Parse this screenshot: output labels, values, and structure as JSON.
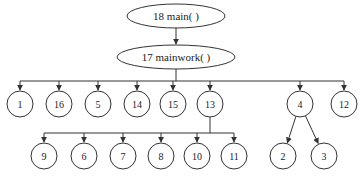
{
  "diagram": {
    "type": "call-tree",
    "nodes": [
      {
        "id": "18",
        "label": "18   main( )",
        "shape": "ellipse",
        "cx": 176,
        "cy": 16,
        "rx": 49,
        "ry": 12
      },
      {
        "id": "17",
        "label": "17   mainwork( )",
        "shape": "ellipse",
        "cx": 176,
        "cy": 57,
        "rx": 59,
        "ry": 12
      },
      {
        "id": "1",
        "label": "1",
        "shape": "circle",
        "cx": 20,
        "cy": 104
      },
      {
        "id": "16",
        "label": "16",
        "shape": "circle",
        "cx": 59,
        "cy": 104
      },
      {
        "id": "5",
        "label": "5",
        "shape": "circle",
        "cx": 98,
        "cy": 104
      },
      {
        "id": "14",
        "label": "14",
        "shape": "circle",
        "cx": 137,
        "cy": 104
      },
      {
        "id": "15",
        "label": "15",
        "shape": "circle",
        "cx": 173,
        "cy": 104
      },
      {
        "id": "13",
        "label": "13",
        "shape": "circle",
        "cx": 210,
        "cy": 104
      },
      {
        "id": "4",
        "label": "4",
        "shape": "circle",
        "cx": 300,
        "cy": 104
      },
      {
        "id": "12",
        "label": "12",
        "shape": "circle",
        "cx": 344,
        "cy": 104
      },
      {
        "id": "9",
        "label": "9",
        "shape": "circle",
        "cx": 44,
        "cy": 156
      },
      {
        "id": "6",
        "label": "6",
        "shape": "circle",
        "cx": 84,
        "cy": 156
      },
      {
        "id": "7",
        "label": "7",
        "shape": "circle",
        "cx": 123,
        "cy": 156
      },
      {
        "id": "8",
        "label": "8",
        "shape": "circle",
        "cx": 161,
        "cy": 156
      },
      {
        "id": "10",
        "label": "10",
        "shape": "circle",
        "cx": 197,
        "cy": 156
      },
      {
        "id": "11",
        "label": "11",
        "shape": "circle",
        "cx": 234,
        "cy": 156
      },
      {
        "id": "2",
        "label": "2",
        "shape": "circle",
        "cx": 283,
        "cy": 156
      },
      {
        "id": "3",
        "label": "3",
        "shape": "circle",
        "cx": 324,
        "cy": 156
      }
    ],
    "edges": [
      {
        "from": "18",
        "to": "17"
      },
      {
        "from": "17",
        "to": "1"
      },
      {
        "from": "17",
        "to": "16"
      },
      {
        "from": "17",
        "to": "5"
      },
      {
        "from": "17",
        "to": "14"
      },
      {
        "from": "17",
        "to": "15"
      },
      {
        "from": "17",
        "to": "13"
      },
      {
        "from": "17",
        "to": "4"
      },
      {
        "from": "17",
        "to": "12"
      },
      {
        "from": "13",
        "to": "9"
      },
      {
        "from": "13",
        "to": "6"
      },
      {
        "from": "13",
        "to": "7"
      },
      {
        "from": "13",
        "to": "8"
      },
      {
        "from": "13",
        "to": "10"
      },
      {
        "from": "13",
        "to": "11"
      },
      {
        "from": "4",
        "to": "2"
      },
      {
        "from": "4",
        "to": "3"
      }
    ],
    "circle_radius": 13
  }
}
